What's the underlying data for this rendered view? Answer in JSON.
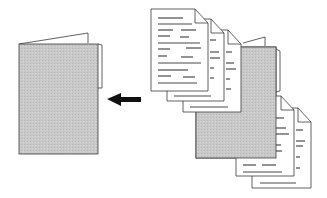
{
  "figure": {
    "description": "Line-art illustration: a stack of text documents and a folder with documents are gathered into a single folder on the left; an arrow points from the documents toward the left folder.",
    "colors": {
      "outline": "#3a3a3a",
      "folder_fill": "#c8c8c8",
      "paper_fill": "#ffffff",
      "text_line": "#4a4a4a",
      "arrow": "#111111"
    },
    "elements": {
      "target_folder": {
        "label": "destination folder"
      },
      "arrow": {
        "label": "arrow pointing left",
        "direction": "left"
      },
      "document_stack_front": {
        "label": "stack of three text documents",
        "count": 3
      },
      "source_folder": {
        "label": "gray folder"
      },
      "document_stack_back": {
        "label": "stack of two text documents",
        "count": 2
      }
    }
  }
}
